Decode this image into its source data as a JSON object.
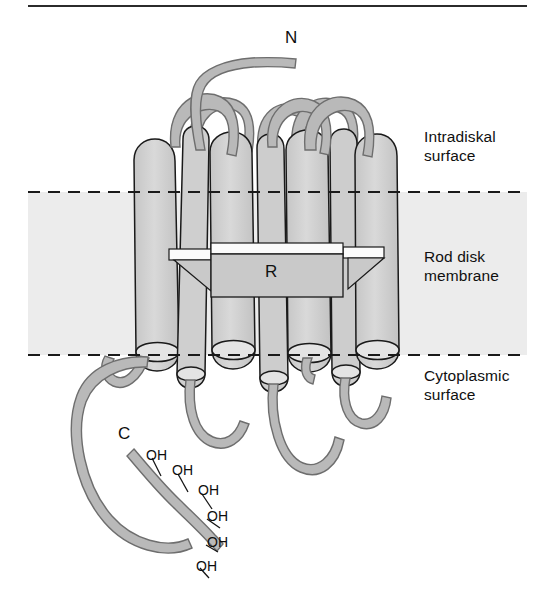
{
  "figure": {
    "title_alt": "Rhodopsin seven-transmembrane helix topology in rod disk membrane",
    "colors": {
      "membrane_band": "#ececec",
      "helix_fill": "#d4d4d4",
      "helix_outline": "#1a1a1a",
      "helix_cap": "#e4e4e4",
      "ribbon_fill": "#b9b9b9",
      "ribbon_outline": "#6e6e6e",
      "retinal_fill": "#c9c9c9",
      "white_strip": "#fbfbfb",
      "dashed_line": "#1a1a1a",
      "top_rule": "#2b2b2b",
      "text": "#101010"
    }
  },
  "terminals": {
    "n_terminus": "N",
    "c_terminus": "C"
  },
  "retinal": {
    "label": "R"
  },
  "region_labels": {
    "intradiskal": "Intradiskal\nsurface",
    "membrane": "Rod disk\nmembrane",
    "cytoplasmic": "Cytoplasmic\nsurface"
  },
  "hydroxyls": [
    {
      "label": "OH",
      "x": 146,
      "y": 447
    },
    {
      "label": "OH",
      "x": 172,
      "y": 462
    },
    {
      "label": "OH",
      "x": 198,
      "y": 482
    },
    {
      "label": "OH",
      "x": 207,
      "y": 508
    },
    {
      "label": "OH",
      "x": 207,
      "y": 534
    },
    {
      "label": "OH",
      "x": 196,
      "y": 558
    }
  ],
  "geometry": {
    "membrane_top_y": 192,
    "membrane_bottom_y": 355,
    "membrane_left_x": 28,
    "membrane_right_x": 527,
    "top_rule_y": 6,
    "helix_count": 7
  }
}
